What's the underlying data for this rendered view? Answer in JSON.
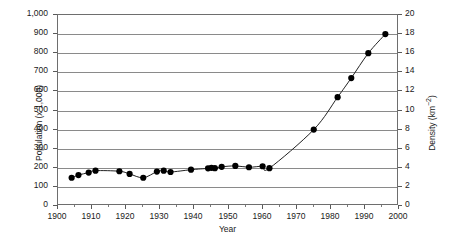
{
  "chart_data": {
    "type": "line",
    "title": "",
    "xlabel": "Year",
    "ylabel": "Population (x 1,000)",
    "ylabel_secondary": "Density (km-2)",
    "xlim": [
      1900,
      2000
    ],
    "ylim": [
      0,
      1000
    ],
    "ylim_secondary": [
      0,
      20
    ],
    "grid": true,
    "legend": "none",
    "marker": "filled-circle",
    "line_color": "#222222",
    "marker_color": "#000000",
    "x_ticks": [
      1900,
      1910,
      1920,
      1930,
      1940,
      1950,
      1960,
      1970,
      1980,
      1990,
      2000
    ],
    "x_tick_labels": [
      "1900",
      "1910",
      "1920",
      "1930",
      "1940",
      "1950",
      "1960",
      "1970",
      "1980",
      "1990",
      "2000"
    ],
    "y_ticks": [
      0,
      100,
      200,
      300,
      400,
      500,
      600,
      700,
      800,
      900,
      1000
    ],
    "y_tick_labels": [
      "0",
      "100",
      "200",
      "300",
      "400",
      "500",
      "600",
      "700",
      "800",
      "900",
      "1,000"
    ],
    "y_ticks_secondary": [
      0,
      2,
      4,
      6,
      8,
      10,
      12,
      14,
      16,
      18,
      20
    ],
    "y_tick_labels_secondary": [
      "0",
      "2",
      "4",
      "6",
      "8",
      "10",
      "12",
      "14",
      "16",
      "18",
      "20"
    ],
    "series": [
      {
        "name": "Population",
        "x": [
          1904,
          1906,
          1909,
          1911,
          1918,
          1921,
          1925,
          1929,
          1931,
          1933,
          1939,
          1944,
          1945,
          1946,
          1948,
          1952,
          1956,
          1960,
          1962,
          1975,
          1982,
          1986,
          1991,
          1996
        ],
        "values": [
          148,
          162,
          175,
          185,
          182,
          168,
          148,
          180,
          185,
          178,
          190,
          197,
          200,
          198,
          205,
          210,
          203,
          208,
          198,
          400,
          570,
          670,
          800,
          900
        ]
      }
    ],
    "annotations": []
  }
}
